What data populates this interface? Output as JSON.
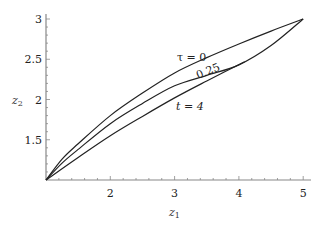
{
  "chart_data": {
    "type": "line",
    "title": "",
    "xlabel": "z1",
    "ylabel": "z2",
    "xlim": [
      1,
      5.1
    ],
    "ylim": [
      1,
      3.05
    ],
    "x_ticks": [
      2,
      3,
      4,
      5
    ],
    "y_ticks": [
      1.5,
      2,
      2.5,
      3
    ],
    "grid": false,
    "legend": "none (inline annotations)",
    "series": [
      {
        "name": "τ = 0",
        "x": [
          1,
          1.25,
          1.5,
          2,
          2.5,
          3,
          3.5,
          4,
          4.5,
          5
        ],
        "y": [
          1,
          1.26,
          1.45,
          1.8,
          2.08,
          2.33,
          2.52,
          2.69,
          2.85,
          3
        ]
      },
      {
        "name": "0.25",
        "x": [
          1,
          1.25,
          1.5,
          2,
          2.5,
          3,
          3.5,
          4,
          4.5,
          5
        ],
        "y": [
          1,
          1.21,
          1.38,
          1.7,
          1.95,
          2.17,
          2.3,
          2.43,
          2.67,
          3
        ]
      },
      {
        "name": "t = 4",
        "x": [
          1,
          1.5,
          2,
          2.5,
          3,
          3.5,
          4.09
        ],
        "y": [
          1,
          1.28,
          1.55,
          1.79,
          2.02,
          2.23,
          2.47
        ]
      }
    ],
    "annotations": [
      {
        "text": "τ = 0",
        "x": 3.2,
        "y": 2.58
      },
      {
        "text": "0.25",
        "x": 3.65,
        "y": 2.42,
        "rotation": -22
      },
      {
        "text": "t = 4",
        "x": 3.0,
        "y": 1.92
      }
    ]
  },
  "labels": {
    "x_axis": "z",
    "x_sub": "1",
    "y_axis": "z",
    "y_sub": "2",
    "ann_tau": "τ = 0",
    "ann_025": "0.25",
    "ann_t4": "t = 4"
  }
}
